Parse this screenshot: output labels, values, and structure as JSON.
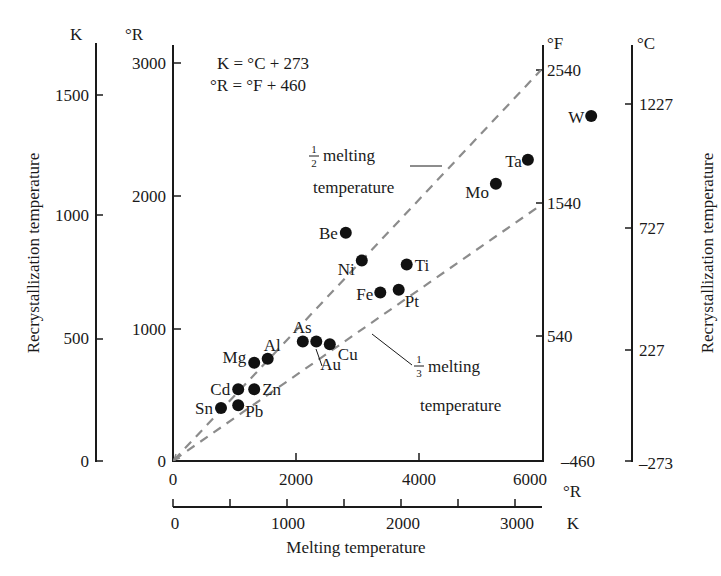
{
  "chart_data": {
    "type": "scatter",
    "title": "",
    "xlabel": "Melting temperature",
    "ylabel_left": "Recrystallization temperature",
    "ylabel_right": "Recrystallization temperature",
    "x_axis_primary": {
      "unit": "°R",
      "range": [
        0,
        6000
      ],
      "ticks": [
        0,
        2000,
        4000,
        6000
      ]
    },
    "x_axis_secondary": {
      "unit": "K",
      "range": [
        0,
        3333
      ],
      "ticks": [
        0,
        1000,
        2000,
        3000
      ],
      "minor_ticks": [
        500,
        1500,
        2500
      ]
    },
    "y_axis_primary": {
      "unit": "°R",
      "range": [
        0,
        3000
      ],
      "ticks": [
        0,
        1000,
        2000,
        3000
      ]
    },
    "y_axis_left_outer": {
      "unit": "K",
      "ticks": [
        0,
        500,
        1000,
        1500
      ]
    },
    "y_axis_right_inner": {
      "unit": "°F",
      "ticks": [
        -460,
        540,
        1540,
        2540
      ]
    },
    "y_axis_right_outer": {
      "unit": "°C",
      "ticks": [
        -273,
        227,
        727,
        1227
      ]
    },
    "annotations": {
      "formula_1": "K = °C + 273",
      "formula_2": "°R = °F + 460",
      "half_line": {
        "fraction_num": "1",
        "fraction_den": "2",
        "text": "melting",
        "text2": "temperature",
        "slope": 0.5
      },
      "third_line": {
        "fraction_num": "1",
        "fraction_den": "3",
        "text": "melting",
        "text2": "temperature",
        "slope": 0.3333
      }
    },
    "points_unit": "°R",
    "points": [
      {
        "label": "Sn",
        "x": 780,
        "y": 400
      },
      {
        "label": "Pb",
        "x": 1060,
        "y": 420
      },
      {
        "label": "Cd",
        "x": 1060,
        "y": 540
      },
      {
        "label": "Zn",
        "x": 1320,
        "y": 540
      },
      {
        "label": "Mg",
        "x": 1320,
        "y": 740
      },
      {
        "label": "Al",
        "x": 1540,
        "y": 770
      },
      {
        "label": "As",
        "x": 2110,
        "y": 900
      },
      {
        "label": "Au",
        "x": 2330,
        "y": 900
      },
      {
        "label": "Cu",
        "x": 2550,
        "y": 880
      },
      {
        "label": "Be",
        "x": 2810,
        "y": 1720
      },
      {
        "label": "Ni",
        "x": 3070,
        "y": 1510
      },
      {
        "label": "Fe",
        "x": 3370,
        "y": 1270
      },
      {
        "label": "Pt",
        "x": 3670,
        "y": 1290
      },
      {
        "label": "Ti",
        "x": 3800,
        "y": 1480
      },
      {
        "label": "Mo",
        "x": 5250,
        "y": 2090
      },
      {
        "label": "Ta",
        "x": 5770,
        "y": 2270
      },
      {
        "label": "W",
        "x": 6800,
        "y": 2600
      }
    ],
    "grid": false,
    "legend": null
  },
  "labels": {
    "unit_K_left": "K",
    "unit_R_left": "°R",
    "unit_F_right": "°F",
    "unit_C_right": "°C",
    "unit_R_bottom": "°R",
    "unit_K_bottom": "K",
    "y_left_title": "Recrystallization temperature",
    "y_right_title": "Recrystallization temperature",
    "x_title": "Melting temperature",
    "formula_1": "K = °C + 273",
    "formula_2": "°R = °F + 460",
    "half_num": "1",
    "half_den": "2",
    "half_text": "melting",
    "half_text2": "temperature",
    "third_num": "1",
    "third_den": "3",
    "third_text": "melting",
    "third_text2": "temperature"
  },
  "ticks": {
    "k_left": [
      "0",
      "500",
      "1000",
      "1500"
    ],
    "r_left": [
      "0",
      "1000",
      "2000",
      "3000"
    ],
    "f_right": [
      "–460",
      "540",
      "1540",
      "2540"
    ],
    "c_right": [
      "–273",
      "227",
      "727",
      "1227"
    ],
    "r_bottom": [
      "0",
      "2000",
      "4000",
      "6000"
    ],
    "k_bottom": [
      "0",
      "1000",
      "2000",
      "3000"
    ]
  },
  "colors": {
    "axis": "#1a1a1a",
    "dashed_line": "#8c8c8c",
    "points": "#111111",
    "background": "#ffffff"
  }
}
